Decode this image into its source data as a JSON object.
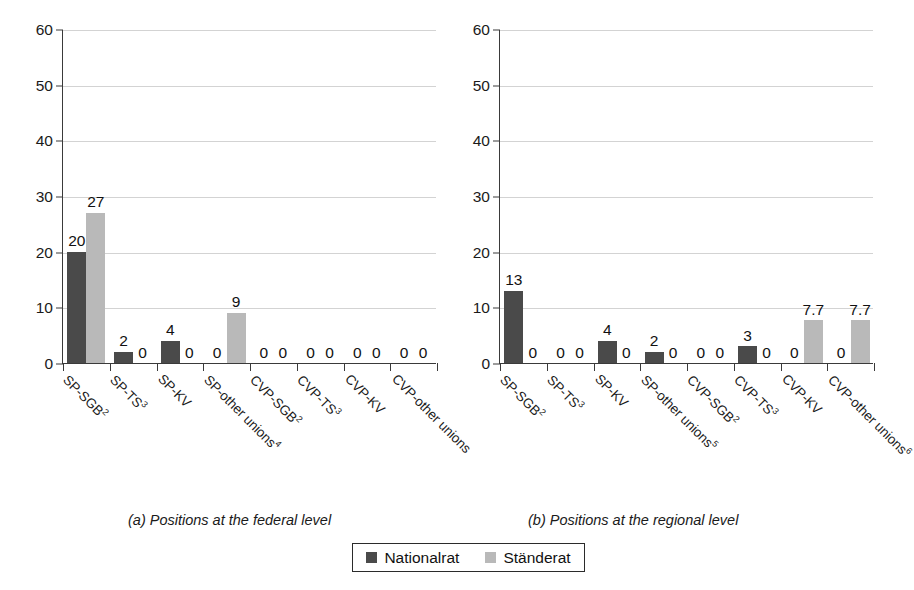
{
  "figure": {
    "legend": {
      "position": "bottom-center",
      "entries": [
        {
          "name": "Nationalrat",
          "color": "#4a4a4a",
          "swatch": "dark"
        },
        {
          "name": "Ständerat",
          "color": "#b9b9b9",
          "swatch": "light"
        }
      ]
    },
    "panels": [
      {
        "id": "a",
        "caption": "(a) Positions at the federal level"
      },
      {
        "id": "b",
        "caption": "(b) Positions at the regional level"
      }
    ]
  },
  "chart_data": [
    {
      "type": "bar",
      "title": "(a) Positions at the federal level",
      "xlabel": "",
      "ylabel": "",
      "ylim": [
        0,
        60
      ],
      "yticks": [
        0,
        10,
        20,
        30,
        40,
        50,
        60
      ],
      "grid": true,
      "legend_position": "bottom-center",
      "categories": [
        "SP-SGB2",
        "SP-TS3",
        "SP-KV",
        "SP-other unions4",
        "CVP-SGB2",
        "CVP-TS3",
        "CVP-KV",
        "CVP-other unions"
      ],
      "category_labels": [
        {
          "text": "SP-SGB",
          "sup": "2"
        },
        {
          "text": "SP-TS",
          "sup": "3"
        },
        {
          "text": "SP-KV",
          "sup": ""
        },
        {
          "text": "SP-other unions",
          "sup": "4"
        },
        {
          "text": "CVP-SGB",
          "sup": "2"
        },
        {
          "text": "CVP-TS",
          "sup": "3"
        },
        {
          "text": "CVP-KV",
          "sup": ""
        },
        {
          "text": "CVP-other unions",
          "sup": ""
        }
      ],
      "series": [
        {
          "name": "Nationalrat",
          "color": "#4a4a4a",
          "values": [
            20,
            2,
            4,
            0,
            0,
            0,
            0,
            0
          ],
          "labels": [
            "20",
            "2",
            "4",
            "0",
            "0",
            "0",
            "0",
            "0"
          ]
        },
        {
          "name": "Ständerat",
          "color": "#b9b9b9",
          "values": [
            27,
            0,
            0,
            9,
            0,
            0,
            0,
            0
          ],
          "labels": [
            "27",
            "0",
            "0",
            "9",
            "0",
            "0",
            "0",
            "0"
          ]
        }
      ]
    },
    {
      "type": "bar",
      "title": "(b) Positions at the regional level",
      "xlabel": "",
      "ylabel": "",
      "ylim": [
        0,
        60
      ],
      "yticks": [
        0,
        10,
        20,
        30,
        40,
        50,
        60
      ],
      "grid": true,
      "legend_position": "bottom-center",
      "categories": [
        "SP-SGB2",
        "SP-TS3",
        "SP-KV",
        "SP-other unions5",
        "CVP-SGB2",
        "CVP-TS3",
        "CVP-KV",
        "CVP-other unions6"
      ],
      "category_labels": [
        {
          "text": "SP-SGB",
          "sup": "2"
        },
        {
          "text": "SP-TS",
          "sup": "3"
        },
        {
          "text": "SP-KV",
          "sup": ""
        },
        {
          "text": "SP-other unions",
          "sup": "5"
        },
        {
          "text": "CVP-SGB",
          "sup": "2"
        },
        {
          "text": "CVP-TS",
          "sup": "3"
        },
        {
          "text": "CVP-KV",
          "sup": ""
        },
        {
          "text": "CVP-other unions",
          "sup": "6"
        }
      ],
      "series": [
        {
          "name": "Nationalrat",
          "color": "#4a4a4a",
          "values": [
            13,
            0,
            4,
            2,
            0,
            3,
            0,
            0
          ],
          "labels": [
            "13",
            "0",
            "4",
            "2",
            "0",
            "3",
            "0",
            "0"
          ]
        },
        {
          "name": "Ständerat",
          "color": "#b9b9b9",
          "values": [
            0,
            0,
            0,
            0,
            0,
            0,
            7.7,
            7.7
          ],
          "labels": [
            "0",
            "0",
            "0",
            "0",
            "0",
            "0",
            "7.7",
            "7.7"
          ]
        }
      ]
    }
  ]
}
